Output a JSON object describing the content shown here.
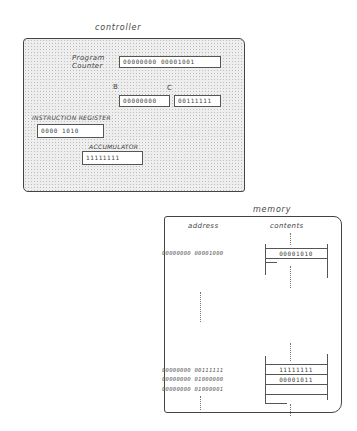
{
  "controller": {
    "title": "controller",
    "program_counter": {
      "label_line1": "Program",
      "label_line2": "Counter",
      "value": "00000000 00001001"
    },
    "register_b": {
      "label": "B",
      "value": "00000000"
    },
    "register_c": {
      "label": "C",
      "value": "00111111"
    },
    "instruction_register": {
      "label": "INSTRUCTION REGISTER",
      "value": "0000 1010"
    },
    "accumulator": {
      "label": "ACCUMULATOR",
      "value": "11111111"
    }
  },
  "memory": {
    "title": "memory",
    "headers": {
      "address": "address",
      "contents": "contents"
    },
    "rows": [
      {
        "address": "00000000 00001000",
        "contents": "00001010"
      },
      {
        "address": "00000000 00111111",
        "contents": "11111111"
      },
      {
        "address": "00000000 01000000",
        "contents": "00001011"
      },
      {
        "address": "00000000 01000001",
        "contents": ""
      }
    ],
    "ellipsis": "⋮"
  }
}
